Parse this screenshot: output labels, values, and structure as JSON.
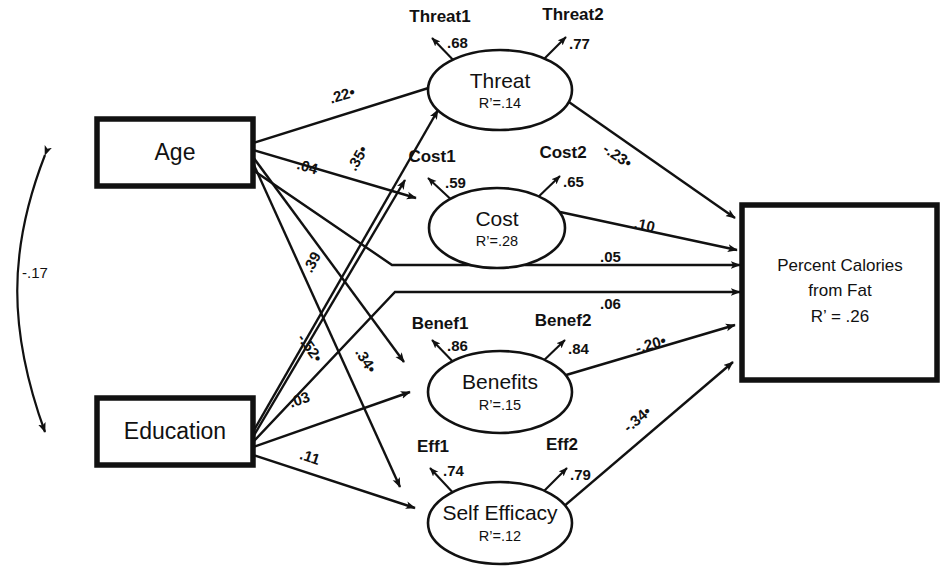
{
  "diagram": {
    "type": "sem-path-diagram",
    "title": "",
    "exogenous_boxes": [
      {
        "id": "age",
        "label": "Age"
      },
      {
        "id": "education",
        "label": "Education"
      }
    ],
    "correlation": {
      "between": [
        "Age",
        "Education"
      ],
      "value": "-.17",
      "style": "double-headed-curve"
    },
    "latent_factors": [
      {
        "id": "threat",
        "label": "Threat",
        "r2_prefix": "R",
        "r2_sup": "2",
        "r2_text": "R’=.14",
        "r2_value": ".14",
        "indicators": [
          {
            "label": "Threat1",
            "loading": ".68"
          },
          {
            "label": "Threat2",
            "loading": ".77"
          }
        ]
      },
      {
        "id": "cost",
        "label": "Cost",
        "r2_text": "R’=.28",
        "r2_value": ".28",
        "indicators": [
          {
            "label": "Cost1",
            "loading": ".59"
          },
          {
            "label": "Cost2",
            "loading": ".65"
          }
        ]
      },
      {
        "id": "benefits",
        "label": "Benefits",
        "r2_text": "R’=.15",
        "r2_value": ".15",
        "indicators": [
          {
            "label": "Benef1",
            "loading": ".86"
          },
          {
            "label": "Benef2",
            "loading": ".84"
          }
        ]
      },
      {
        "id": "self_efficacy",
        "label": "Self Efficacy",
        "r2_text": "R’=.12",
        "r2_value": ".12",
        "indicators": [
          {
            "label": "Eff1",
            "loading": ".74"
          },
          {
            "label": "Eff2",
            "loading": ".79"
          }
        ]
      }
    ],
    "outcome_box": {
      "id": "percent_calories_from_fat",
      "line1": "Percent Calories",
      "line2": "from Fat",
      "line3": "R’ = .26",
      "r2_value": ".26"
    },
    "structural_paths": [
      {
        "id": "age-threat",
        "from": "Age",
        "to": "Threat",
        "value": ".22•"
      },
      {
        "id": "age-cost",
        "from": "Age",
        "to": "Cost",
        "value": ".04"
      },
      {
        "id": "education-cost",
        "from": "Education",
        "to": "Cost",
        "value": ".35•"
      },
      {
        "id": "age-benefits",
        "from": "Age",
        "to": "Benefits",
        "value": "-.52•"
      },
      {
        "id": "education-threat",
        "from": "Education",
        "to": "Threat",
        "value": ".39"
      },
      {
        "id": "age-efficacy",
        "from": "Age",
        "to": "Self Efficacy",
        "value": ".34•"
      },
      {
        "id": "education-benefits",
        "from": "Education",
        "to": "Benefits",
        "value": ".03"
      },
      {
        "id": "education-efficacy",
        "from": "Education",
        "to": "Self Efficacy",
        "value": ".11"
      },
      {
        "id": "threat-outcome",
        "from": "Threat",
        "to": "Percent Calories from Fat",
        "value": "-.23•"
      },
      {
        "id": "cost-outcome",
        "from": "Cost",
        "to": "Percent Calories from Fat",
        "value": ".10"
      },
      {
        "id": "age-outcome",
        "from": "Age",
        "to": "Percent Calories from Fat",
        "value": ".05"
      },
      {
        "id": "education-outcome",
        "from": "Education",
        "to": "Percent Calories from Fat",
        "value": ".06"
      },
      {
        "id": "benefits-outcome",
        "from": "Benefits",
        "to": "Percent Calories from Fat",
        "value": "-.20•"
      },
      {
        "id": "efficacy-outcome",
        "from": "Self Efficacy",
        "to": "Percent Calories from Fat",
        "value": "-.34•"
      }
    ],
    "colors": {
      "stroke": "#111111",
      "background": "#ffffff"
    }
  }
}
